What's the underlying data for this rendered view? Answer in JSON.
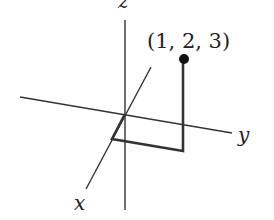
{
  "diagram": {
    "title": "",
    "axes": [
      {
        "name": "x",
        "label": "x"
      },
      {
        "name": "y",
        "label": "y"
      },
      {
        "name": "z",
        "label": "z"
      }
    ],
    "point": {
      "label": "(1, 2, 3)",
      "coords": [
        1,
        2,
        3
      ]
    },
    "colors": {
      "line": "#222222",
      "path": "#333333",
      "point": "#111111"
    }
  }
}
